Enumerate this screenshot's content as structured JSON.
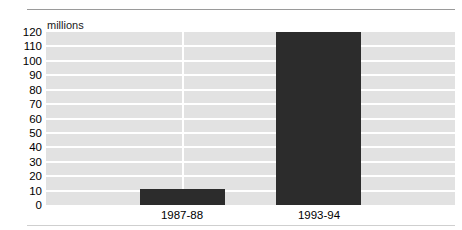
{
  "chart_data": {
    "type": "bar",
    "title": "",
    "subtitle": "",
    "unit_label": "millions",
    "categories": [
      "1987-88",
      "1993-94"
    ],
    "values": [
      11,
      120
    ],
    "series": [
      {
        "name": "millions",
        "values": [
          11,
          120
        ]
      }
    ],
    "xlabel": "",
    "ylabel": "millions",
    "ylim": [
      0,
      120
    ],
    "ytick_values": [
      0,
      10,
      20,
      30,
      40,
      50,
      60,
      70,
      80,
      90,
      100,
      110,
      120
    ],
    "ytick_labels": [
      "0",
      "10",
      "20",
      "30",
      "40",
      "50",
      "60",
      "70",
      "80",
      "90",
      "100",
      "110",
      "120"
    ],
    "grid": true,
    "grid_orientation": "horizontal-and-vertical",
    "legend": false,
    "legend_position": "none",
    "colors": {
      "bar": "#2c2c2c",
      "plot_background": "#e2e2e2",
      "gridline": "#ffffff",
      "rule": "#9a9a9a",
      "text": "#000000",
      "page_background": "#ffffff"
    },
    "annotations": []
  }
}
